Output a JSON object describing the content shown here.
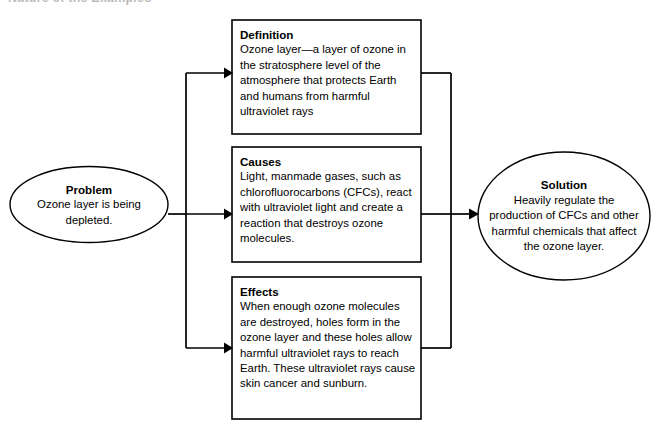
{
  "page": {
    "title": "Nature of the Examples",
    "background_color": "#ffffff",
    "line_color": "#000000"
  },
  "diagram": {
    "type": "problem-solution-flow",
    "problem": {
      "heading": "Problem",
      "body": "Ozone layer is being depleted."
    },
    "middle_boxes": [
      {
        "heading": "Definition",
        "body": "Ozone layer—a layer of ozone in the stratosphere level of the atmosphere that protects Earth and humans from harmful ultraviolet rays"
      },
      {
        "heading": "Causes",
        "body": "Light, manmade gases, such as chlorofluorocarbons (CFCs), react with ultraviolet light and create a reaction that destroys ozone molecules."
      },
      {
        "heading": "Effects",
        "body": "When enough ozone molecules are destroyed, holes form in the ozone layer and these holes allow harmful ultraviolet rays to reach Earth. These ultraviolet rays cause skin cancer and sunburn."
      }
    ],
    "solution": {
      "heading": "Solution",
      "body": "Heavily regulate the production of CFCs and other harmful chemicals that affect the ozone layer."
    }
  }
}
